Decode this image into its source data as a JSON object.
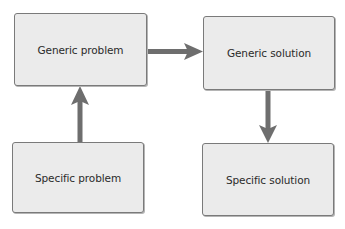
{
  "diagram": {
    "nodes": [
      {
        "id": "generic-problem",
        "label": "Generic problem"
      },
      {
        "id": "generic-solution",
        "label": "Generic solution"
      },
      {
        "id": "specific-problem",
        "label": "Specific problem"
      },
      {
        "id": "specific-solution",
        "label": "Specific solution"
      }
    ],
    "edges": [
      {
        "from": "specific-problem",
        "to": "generic-problem",
        "direction": "up"
      },
      {
        "from": "generic-problem",
        "to": "generic-solution",
        "direction": "right"
      },
      {
        "from": "generic-solution",
        "to": "specific-solution",
        "direction": "down"
      }
    ],
    "colors": {
      "box_fill": "#ebebeb",
      "box_border": "#7a7a7a",
      "arrow": "#6e6e6e",
      "text": "#2a2a2a"
    }
  }
}
